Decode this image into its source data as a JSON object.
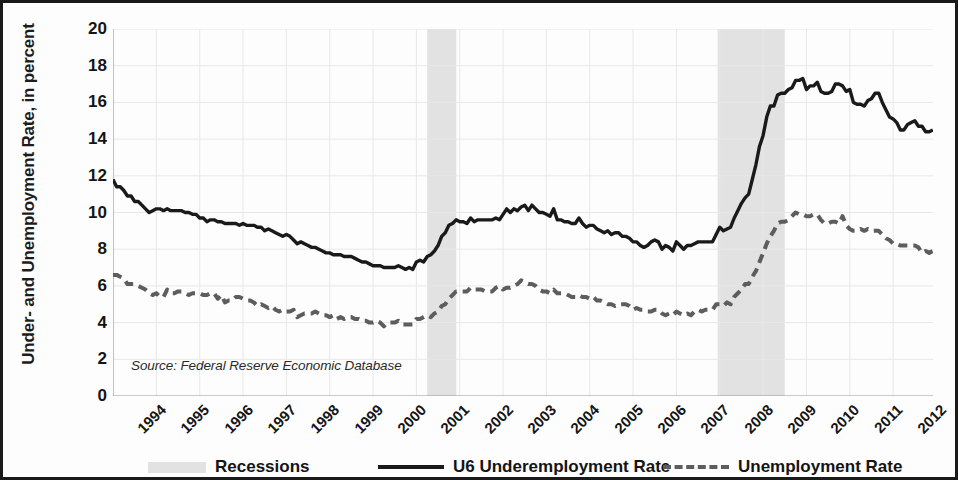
{
  "chart_data": {
    "type": "line",
    "title": "",
    "xlabel": "",
    "ylabel": "Under- and Unemployment Rate, in percent",
    "ylim": [
      0,
      20
    ],
    "ytick_labels": [
      "0",
      "2",
      "4",
      "6",
      "8",
      "10",
      "12",
      "14",
      "16",
      "18",
      "20"
    ],
    "ytick_values": [
      0,
      2,
      4,
      6,
      8,
      10,
      12,
      14,
      16,
      18,
      20
    ],
    "xlim": [
      1994.0,
      2012.92
    ],
    "xtick_labels": [
      "1994",
      "1995",
      "1996",
      "1997",
      "1998",
      "1999",
      "2000",
      "2001",
      "2002",
      "2003",
      "2004",
      "2005",
      "2006",
      "2007",
      "2008",
      "2009",
      "2010",
      "2011",
      "2012"
    ],
    "xtick_values": [
      1994,
      1995,
      1996,
      1997,
      1998,
      1999,
      2000,
      2001,
      2002,
      2003,
      2004,
      2005,
      2006,
      2007,
      2008,
      2009,
      2010,
      2011,
      2012
    ],
    "grid": true,
    "legend_position": "bottom",
    "source_note": "Source: Federal Reserve Economic Database",
    "shaded_regions": [
      {
        "label": "Recession 2001",
        "start": 2001.25,
        "end": 2001.92
      },
      {
        "label": "Recession 2008-2009",
        "start": 2007.95,
        "end": 2009.5
      }
    ],
    "series": [
      {
        "name": "U6 Underemployment Rate",
        "style": "solid",
        "color": "#1a1a1a",
        "x_start": 1994.0,
        "x_step": 0.0833333,
        "values": [
          11.8,
          11.4,
          11.4,
          11.2,
          10.9,
          10.9,
          10.6,
          10.6,
          10.4,
          10.2,
          10.0,
          10.1,
          10.2,
          10.2,
          10.1,
          10.2,
          10.1,
          10.1,
          10.1,
          10.1,
          10.0,
          10.0,
          9.9,
          9.9,
          9.7,
          9.7,
          9.5,
          9.6,
          9.6,
          9.5,
          9.5,
          9.4,
          9.4,
          9.4,
          9.4,
          9.3,
          9.4,
          9.3,
          9.3,
          9.3,
          9.2,
          9.2,
          9.0,
          9.1,
          9.0,
          8.9,
          8.8,
          8.7,
          8.8,
          8.7,
          8.5,
          8.3,
          8.4,
          8.3,
          8.2,
          8.1,
          8.1,
          8.0,
          7.9,
          7.8,
          7.8,
          7.7,
          7.7,
          7.7,
          7.6,
          7.6,
          7.6,
          7.5,
          7.4,
          7.3,
          7.3,
          7.2,
          7.1,
          7.1,
          7.1,
          7.0,
          7.0,
          7.0,
          7.0,
          7.1,
          7.0,
          6.9,
          7.0,
          6.9,
          7.3,
          7.4,
          7.3,
          7.6,
          7.7,
          7.9,
          8.2,
          8.7,
          8.9,
          9.3,
          9.4,
          9.6,
          9.5,
          9.5,
          9.4,
          9.7,
          9.5,
          9.6,
          9.6,
          9.6,
          9.6,
          9.6,
          9.7,
          9.6,
          9.9,
          10.2,
          10.0,
          10.2,
          10.1,
          10.3,
          10.4,
          10.1,
          10.4,
          10.2,
          10.0,
          10.0,
          9.9,
          9.8,
          10.2,
          9.6,
          9.6,
          9.5,
          9.5,
          9.4,
          9.4,
          9.7,
          9.4,
          9.2,
          9.3,
          9.3,
          9.1,
          9.0,
          8.9,
          9.0,
          8.8,
          8.9,
          8.9,
          8.7,
          8.7,
          8.6,
          8.4,
          8.4,
          8.2,
          8.1,
          8.2,
          8.4,
          8.5,
          8.4,
          8.0,
          8.2,
          8.1,
          7.9,
          8.4,
          8.2,
          8.0,
          8.2,
          8.2,
          8.3,
          8.4,
          8.4,
          8.4,
          8.4,
          8.4,
          8.8,
          9.2,
          9.0,
          9.1,
          9.2,
          9.7,
          10.1,
          10.5,
          10.8,
          11.0,
          11.8,
          12.6,
          13.6,
          14.2,
          15.2,
          15.8,
          15.8,
          16.4,
          16.5,
          16.5,
          16.7,
          16.8,
          17.2,
          17.2,
          17.3,
          16.7,
          16.9,
          16.9,
          17.1,
          16.6,
          16.5,
          16.5,
          16.6,
          17.0,
          17.0,
          16.9,
          16.6,
          16.7,
          16.0,
          15.9,
          15.9,
          15.8,
          16.1,
          16.2,
          16.5,
          16.5,
          16.0,
          15.6,
          15.2,
          15.1,
          14.9,
          14.5,
          14.5,
          14.8,
          14.9,
          15.0,
          14.7,
          14.7,
          14.4,
          14.4,
          14.5
        ]
      },
      {
        "name": "Unemployment Rate",
        "style": "dashed",
        "color": "#5d5d5d",
        "x_start": 1994.0,
        "x_step": 0.0833333,
        "values": [
          6.6,
          6.6,
          6.5,
          6.4,
          6.1,
          6.1,
          6.1,
          6.0,
          5.9,
          5.8,
          5.6,
          5.5,
          5.6,
          5.4,
          5.4,
          5.8,
          5.6,
          5.6,
          5.7,
          5.7,
          5.6,
          5.5,
          5.6,
          5.6,
          5.6,
          5.5,
          5.5,
          5.6,
          5.6,
          5.3,
          5.5,
          5.1,
          5.2,
          5.2,
          5.4,
          5.4,
          5.3,
          5.2,
          5.2,
          5.1,
          4.9,
          5.0,
          4.9,
          4.8,
          4.9,
          4.7,
          4.6,
          4.7,
          4.6,
          4.6,
          4.7,
          4.3,
          4.4,
          4.5,
          4.5,
          4.5,
          4.6,
          4.5,
          4.4,
          4.4,
          4.3,
          4.4,
          4.2,
          4.3,
          4.2,
          4.3,
          4.3,
          4.2,
          4.2,
          4.1,
          4.1,
          4.0,
          4.0,
          4.1,
          4.0,
          3.8,
          4.0,
          4.0,
          4.0,
          4.1,
          3.9,
          3.9,
          3.9,
          3.9,
          4.2,
          4.2,
          4.3,
          4.4,
          4.3,
          4.5,
          4.6,
          4.9,
          5.0,
          5.3,
          5.5,
          5.7,
          5.7,
          5.7,
          5.7,
          5.9,
          5.8,
          5.8,
          5.8,
          5.7,
          5.7,
          5.7,
          5.9,
          6.0,
          5.8,
          5.9,
          5.9,
          6.0,
          6.1,
          6.3,
          6.2,
          6.1,
          6.1,
          6.0,
          5.8,
          5.7,
          5.7,
          5.6,
          5.8,
          5.6,
          5.6,
          5.6,
          5.5,
          5.4,
          5.4,
          5.5,
          5.4,
          5.4,
          5.3,
          5.4,
          5.2,
          5.2,
          5.1,
          5.0,
          5.0,
          4.9,
          5.0,
          5.0,
          5.0,
          4.9,
          4.7,
          4.8,
          4.7,
          4.7,
          4.6,
          4.6,
          4.7,
          4.7,
          4.5,
          4.4,
          4.5,
          4.4,
          4.6,
          4.5,
          4.4,
          4.5,
          4.4,
          4.6,
          4.7,
          4.6,
          4.7,
          4.7,
          4.7,
          5.0,
          5.0,
          4.9,
          5.1,
          5.0,
          5.4,
          5.6,
          5.8,
          6.1,
          6.1,
          6.5,
          6.8,
          7.3,
          7.8,
          8.3,
          8.7,
          9.0,
          9.4,
          9.5,
          9.5,
          9.6,
          9.8,
          10.0,
          9.9,
          9.9,
          9.8,
          9.8,
          9.9,
          9.9,
          9.6,
          9.4,
          9.4,
          9.5,
          9.5,
          9.4,
          9.8,
          9.3,
          9.1,
          9.0,
          9.0,
          9.1,
          9.0,
          9.1,
          9.0,
          9.0,
          9.0,
          8.8,
          8.6,
          8.5,
          8.3,
          8.3,
          8.2,
          8.2,
          8.2,
          8.2,
          8.2,
          8.1,
          7.8,
          7.9,
          7.8,
          7.9
        ]
      }
    ]
  },
  "legend": {
    "items": [
      {
        "label": "Recessions",
        "swatch": "band-swatch"
      },
      {
        "label": "U6 Underemployment Rate",
        "swatch": "solid-line-swatch"
      },
      {
        "label": "Unemployment Rate",
        "swatch": "dashed-line-swatch"
      }
    ]
  },
  "colors": {
    "line_u6": "#1a1a1a",
    "line_unemployment": "#5d5d5d",
    "recession_band": "#e2e2e2",
    "grid": "#e8e8e8",
    "axis": "#9a9a9a",
    "border": "#1a1a1a"
  }
}
